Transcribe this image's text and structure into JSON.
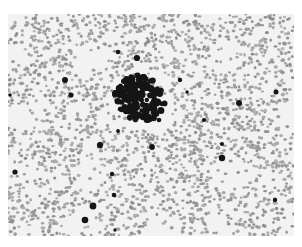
{
  "image": {
    "description": "Grayscale micrograph of a blood smear with scattered red cells and a dense dark cell cluster near the center",
    "colors": {
      "background": "#ffffff",
      "field": "#f2f2f2",
      "cells": "#9a9a9a",
      "dark_cells": "#151515"
    },
    "cluster": {
      "cx": 138,
      "cy": 98,
      "r": 24
    },
    "dark_dots": [
      [
        118,
        52
      ],
      [
        137,
        58
      ],
      [
        180,
        80
      ],
      [
        187,
        92
      ],
      [
        239,
        103
      ],
      [
        276,
        92
      ],
      [
        71,
        95
      ],
      [
        65,
        80
      ],
      [
        10,
        95
      ],
      [
        222,
        144
      ],
      [
        118,
        131
      ],
      [
        152,
        147
      ],
      [
        100,
        145
      ],
      [
        159,
        120
      ],
      [
        204,
        120
      ],
      [
        15,
        172
      ],
      [
        112,
        174
      ],
      [
        114,
        195
      ],
      [
        275,
        200
      ],
      [
        85,
        220
      ],
      [
        115,
        230
      ],
      [
        222,
        158
      ],
      [
        93,
        206
      ]
    ]
  }
}
